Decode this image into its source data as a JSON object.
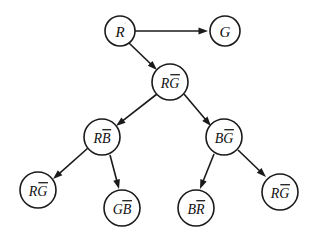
{
  "diagram": {
    "type": "directed-tree",
    "colors": {
      "stroke": "#1a1a1a",
      "node_fill": "#ffffff",
      "background": "#ffffff",
      "text": "#111111"
    },
    "nodes": [
      {
        "id": "n1",
        "label": "RG",
        "plain": "R",
        "barred": "G",
        "bar": "over-second",
        "cx": 120,
        "cy": 31,
        "r": 15,
        "font_size": 15,
        "display": "R"
      },
      {
        "id": "n2",
        "label": "G",
        "plain": "G",
        "barred": "",
        "bar": "none",
        "cx": 225,
        "cy": 31,
        "r": 15,
        "font_size": 15,
        "display": "G"
      },
      {
        "id": "n3",
        "label": "RG-bar",
        "plain": "R",
        "barred": "G",
        "bar": "over-second",
        "cx": 170,
        "cy": 82,
        "r": 18,
        "font_size": 14,
        "display": "RG"
      },
      {
        "id": "n4",
        "label": "RB-bar",
        "plain": "R",
        "barred": "B",
        "bar": "over-second",
        "cx": 102,
        "cy": 137,
        "r": 18,
        "font_size": 14,
        "display": "RB"
      },
      {
        "id": "n5",
        "label": "BG-bar",
        "plain": "B",
        "barred": "G",
        "bar": "over-second",
        "cx": 224,
        "cy": 137,
        "r": 18,
        "font_size": 14,
        "display": "BG"
      },
      {
        "id": "n6",
        "label": "RG-bar",
        "plain": "R",
        "barred": "G",
        "bar": "over-second",
        "cx": 38,
        "cy": 190,
        "r": 18,
        "font_size": 14,
        "display": "RG"
      },
      {
        "id": "n7",
        "label": "GB-bar",
        "plain": "G",
        "barred": "B",
        "bar": "over-second",
        "cx": 122,
        "cy": 208,
        "r": 18,
        "font_size": 14,
        "display": "GB"
      },
      {
        "id": "n8",
        "label": "BR-bar",
        "plain": "B",
        "barred": "R",
        "bar": "over-second",
        "cx": 196,
        "cy": 208,
        "r": 18,
        "font_size": 14,
        "display": "BR"
      },
      {
        "id": "n9",
        "label": "RG-bar",
        "plain": "R",
        "barred": "G",
        "bar": "over-second",
        "cx": 280,
        "cy": 192,
        "r": 18,
        "font_size": 14,
        "display": "RG"
      }
    ],
    "edges": [
      {
        "id": "e1",
        "from": "n1",
        "to": "n2",
        "x1": 135,
        "y1": 31,
        "x2": 208,
        "y2": 31
      },
      {
        "id": "e2",
        "from": "n1",
        "to": "n3",
        "x1": 129,
        "y1": 43,
        "x2": 157,
        "y2": 70
      },
      {
        "id": "e3",
        "from": "n3",
        "to": "n4",
        "x1": 157,
        "y1": 94,
        "x2": 116,
        "y2": 126
      },
      {
        "id": "e4",
        "from": "n3",
        "to": "n5",
        "x1": 184,
        "y1": 94,
        "x2": 211,
        "y2": 126
      },
      {
        "id": "e5",
        "from": "n4",
        "to": "n6",
        "x1": 88,
        "y1": 148,
        "x2": 53,
        "y2": 179
      },
      {
        "id": "e6",
        "from": "n4",
        "to": "n7",
        "x1": 110,
        "y1": 155,
        "x2": 119,
        "y2": 189
      },
      {
        "id": "e7",
        "from": "n5",
        "to": "n8",
        "x1": 214,
        "y1": 154,
        "x2": 200,
        "y2": 189
      },
      {
        "id": "e8",
        "from": "n5",
        "to": "n9",
        "x1": 238,
        "y1": 150,
        "x2": 266,
        "y2": 177
      }
    ]
  }
}
